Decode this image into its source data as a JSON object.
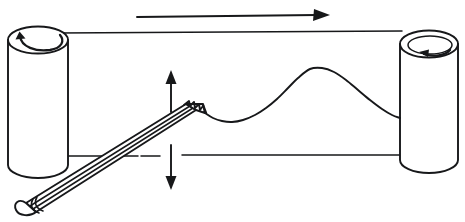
{
  "figure": {
    "title": "Chart recorder with paper roll and pencil stylus",
    "type": "line-drawing",
    "width": 465,
    "height": 222,
    "background_color": "#ffffff",
    "ink_color": "#17181a"
  },
  "parts": {
    "left_roller": {
      "label": "left-roller",
      "rotation_arrow": "counter-clockwise-curved-arrow",
      "center_x": 38,
      "top_y": 36,
      "bottom_y": 176,
      "radius_x": 30,
      "radius_y": 14
    },
    "right_roller": {
      "label": "right-roller",
      "rotation_arrow": "counter-clockwise-curved-arrow",
      "center_x": 429,
      "top_y": 40,
      "bottom_y": 172,
      "radius_x": 29,
      "radius_y": 14
    },
    "paper_strip": {
      "label": "paper-strip",
      "top_edge_y": 33,
      "bottom_edge_y": 156,
      "left_x": 58,
      "right_x": 400
    },
    "pencil": {
      "label": "pencil-stylus",
      "tip_x": 205,
      "tip_y": 112,
      "eraser_x": 22,
      "eraser_y": 210,
      "ferrule_bands": 2,
      "has_sharpened_tip": true
    },
    "trace": {
      "label": "pen-trace-curve",
      "start_x": 205,
      "start_y": 113,
      "end_x": 400,
      "end_y": 118
    }
  },
  "arrows": {
    "paper_direction": {
      "label": "paper-feed-direction-arrow",
      "direction": "right",
      "from_x": 137,
      "to_x": 330,
      "y": 16
    },
    "stylus_motion": {
      "label": "stylus-vertical-motion-arrow",
      "direction": "up-down",
      "x": 171,
      "top_y": 70,
      "bottom_y": 190
    }
  },
  "chart_data": {
    "type": "line",
    "xlabel": "",
    "ylabel": "",
    "grid": false,
    "legend": null,
    "xlim": [
      205,
      400
    ],
    "ylim": [
      68,
      125
    ],
    "note": "Single smooth recorded waveform drawn by the pencil stylus onto the moving paper strip; y values are screen pixels where smaller is higher on the page.",
    "series": [
      {
        "name": "pen trace",
        "x": [
          205,
          213,
          222,
          232,
          243,
          255,
          266,
          277,
          288,
          298,
          310,
          322,
          334,
          346,
          358,
          370,
          382,
          392,
          400
        ],
        "y": [
          113,
          118,
          121,
          122,
          120,
          115,
          108,
          99,
          88,
          78,
          69,
          68,
          72,
          80,
          90,
          100,
          109,
          115,
          118
        ]
      }
    ]
  }
}
